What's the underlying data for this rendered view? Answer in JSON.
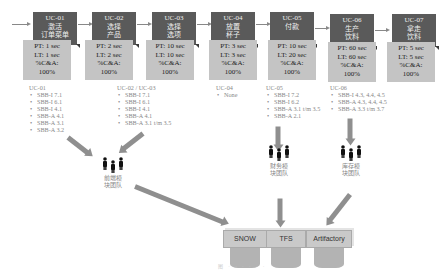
{
  "process_steps": [
    {
      "id": "UC-01",
      "name": "激活\n订单菜单",
      "pt": "PT: 1 sec",
      "lt": "LT: 1 sec",
      "ca_label": "%C&A:",
      "ca_value": "100%"
    },
    {
      "id": "UC-02",
      "name": "选择\n产品",
      "pt": "PT: 2 sec",
      "lt": "LT: 2 sec",
      "ca_label": "%C&A:",
      "ca_value": "100%"
    },
    {
      "id": "UC-03",
      "name": "选择\n选项",
      "pt": "PT: 10 sec",
      "lt": "LT: 10 sec",
      "ca_label": "%C&A:",
      "ca_value": "100%"
    },
    {
      "id": "UC-04",
      "name": "放置\n杯子",
      "pt": "PT: 3 sec",
      "lt": "LT: 3 sec",
      "ca_label": "%C&A:",
      "ca_value": "100%"
    },
    {
      "id": "UC-05",
      "name": "付款",
      "pt": "PT: 10 sec",
      "lt": "LT: 20 sec",
      "ca_label": "%C&A:",
      "ca_value": "100%"
    },
    {
      "id": "UC-06",
      "name": "生产\n饮料",
      "pt": "PT: 60 sec",
      "lt": "LT: 60 sec",
      "ca_label": "%C&A:",
      "ca_value": "100%"
    },
    {
      "id": "UC-07",
      "name": "拿走\n饮料",
      "pt": "PT: 5 sec",
      "lt": "LT: 5 sec",
      "ca_label": "%C&A:",
      "ca_value": "100%"
    }
  ],
  "requirement_lists": [
    {
      "title": "UC-01",
      "items": [
        "SBB-I 7.1",
        "SBB-I 6.1",
        "SBB-I 4.1",
        "SBB-A 4.1",
        "SBB-A 3.1",
        "SBB-A 3.2"
      ]
    },
    {
      "title": "UC-02 / UC-03",
      "items": [
        "SBB-I 7.1",
        "SBB-I 6.1",
        "SBB-I 4.1",
        "SBB-A 4.1",
        "SBB-A 3.1 t/m 3.5"
      ]
    },
    {
      "title": "UC-04",
      "items": [
        "None"
      ]
    },
    {
      "title": "UC-05",
      "items": [
        "SBB-I 7.2",
        "SBB-I 6.2",
        "SBB-A 3.1 t/m 3.5",
        "SBB-A 2.1"
      ]
    },
    {
      "title": "UC-06",
      "items": [
        "SBB-I 4.3, 4.4, 4.5",
        "SBB-A 4.3, 4.4, 4.5",
        "SBB-A 3.3 t/m 3.7"
      ]
    }
  ],
  "teams": [
    {
      "label": "前端模块团队",
      "icon": "people-icon"
    },
    {
      "label": "财务模块团队",
      "icon": "people-icon"
    },
    {
      "label": "库存模块团队",
      "icon": "people-icon"
    }
  ],
  "systems": [
    {
      "label": "SNOW",
      "icon": "database-icon"
    },
    {
      "label": "TFS",
      "icon": "database-icon"
    },
    {
      "label": "Artifactory",
      "icon": "database-icon"
    }
  ],
  "footer": {
    "caption": "图 ·  ·  ·  ·  ·  ·"
  }
}
